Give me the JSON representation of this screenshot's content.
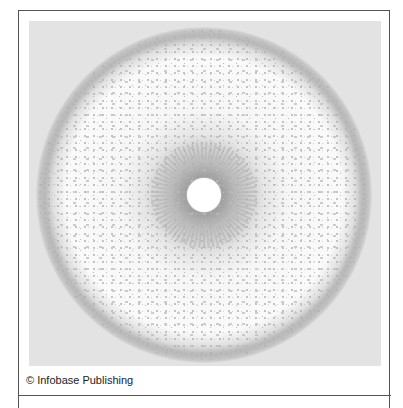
{
  "figure": {
    "credit": "© Infobase Publishing",
    "colors": {
      "background": "#e3e3e3",
      "ring": "#a8a8a8",
      "halo": "#9e9e9e",
      "interior": "#f7f7f7",
      "border": "#555555"
    }
  }
}
